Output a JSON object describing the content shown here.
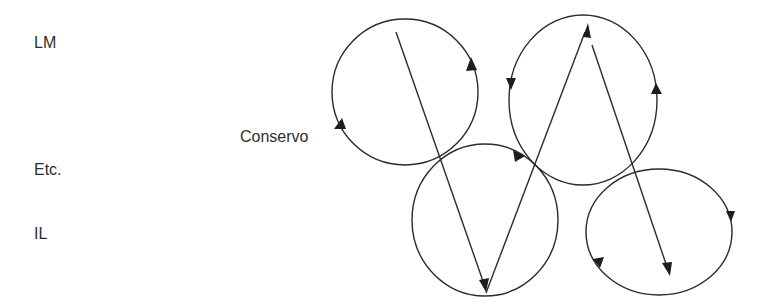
{
  "labels": {
    "lm": "LM",
    "etc": "Etc.",
    "il": "IL",
    "conservo": "Conservo"
  },
  "colors": {
    "stroke": "#2b2b2b",
    "text": "#2e2e2e",
    "background": "#ffffff"
  },
  "diagram": {
    "circles": [
      {
        "id": "circle-top-left",
        "cx": 405,
        "cy": 92,
        "rx": 73,
        "ry": 73,
        "direction": "counterclockwise"
      },
      {
        "id": "circle-top-right",
        "cx": 583,
        "cy": 100,
        "rx": 74,
        "ry": 80,
        "direction": "counterclockwise"
      },
      {
        "id": "circle-bottom-middle",
        "cx": 485,
        "cy": 220,
        "rx": 73,
        "ry": 75,
        "direction": "clockwise"
      },
      {
        "id": "circle-bottom-right",
        "cx": 660,
        "cy": 232,
        "rx": 73,
        "ry": 62,
        "direction": "clockwise"
      }
    ],
    "vectors": [
      {
        "id": "vector-1",
        "from": [
          396,
          32
        ],
        "to": [
          486,
          290
        ]
      },
      {
        "id": "vector-2",
        "from": [
          486,
          293
        ],
        "to": [
          588,
          24
        ]
      },
      {
        "id": "vector-3",
        "from": [
          592,
          45
        ],
        "to": [
          670,
          276
        ]
      }
    ]
  }
}
